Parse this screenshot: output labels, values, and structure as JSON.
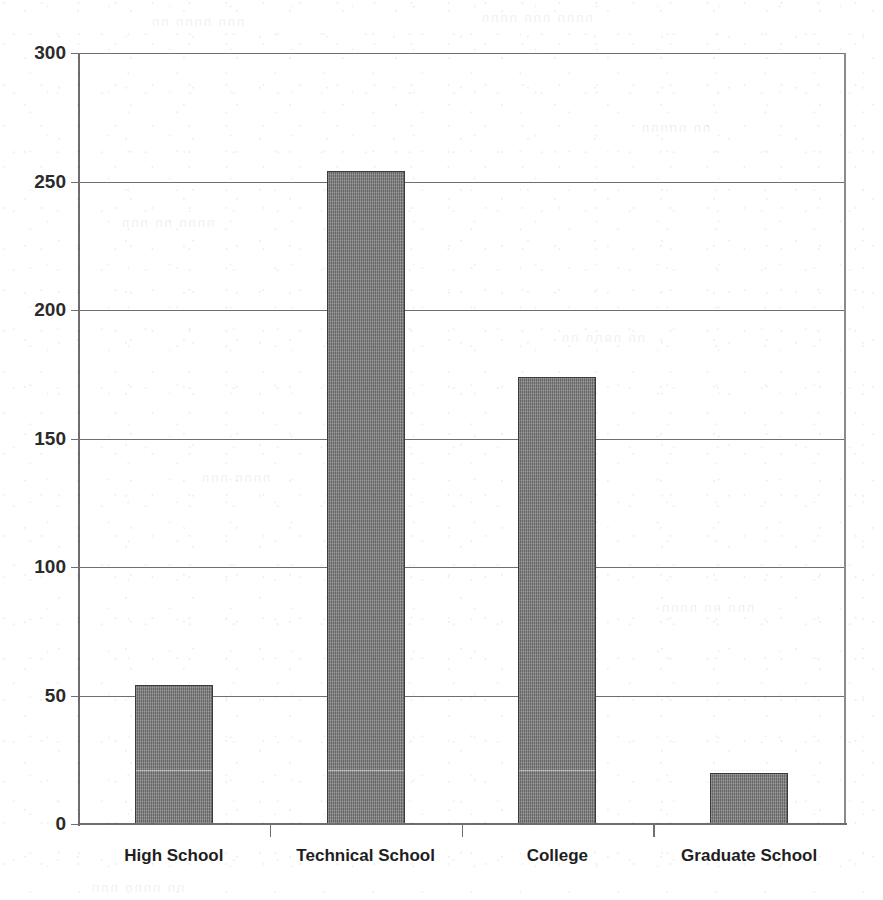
{
  "chart_data": {
    "type": "bar",
    "title": "",
    "subtitle": "",
    "xlabel": "",
    "ylabel": "",
    "categories": [
      "High School",
      "Technical School",
      "College",
      "Graduate School"
    ],
    "values": [
      54,
      254,
      174,
      20
    ],
    "series": [
      {
        "name": "Count",
        "values": [
          54,
          254,
          174,
          20
        ]
      }
    ],
    "ylim": [
      0,
      300
    ],
    "ytick_labels": [
      "0",
      "50",
      "100",
      "150",
      "200",
      "250",
      "300"
    ],
    "ytick_values": [
      0,
      50,
      100,
      150,
      200,
      250,
      300
    ],
    "grid": "horizontal",
    "legend": "none",
    "bar_color": "#7a7a7a",
    "bar_border_color": "#3b3b3b",
    "gridline_color": "#6f6f6f",
    "axis_color": "#6e6e6e",
    "background_color": "#ffffff",
    "annotations": []
  },
  "scan_artifacts": {
    "ghost_lines": [
      "nnn  nnnn  nn",
      "nnnn   nnn  nnnn",
      "nn  nnnnn",
      "nnnn  nn   nnn",
      "nn   nnnn  nn",
      "nnnn  nnn",
      "nnn  nn  nnnn",
      "nn nnnn  nnn"
    ]
  }
}
